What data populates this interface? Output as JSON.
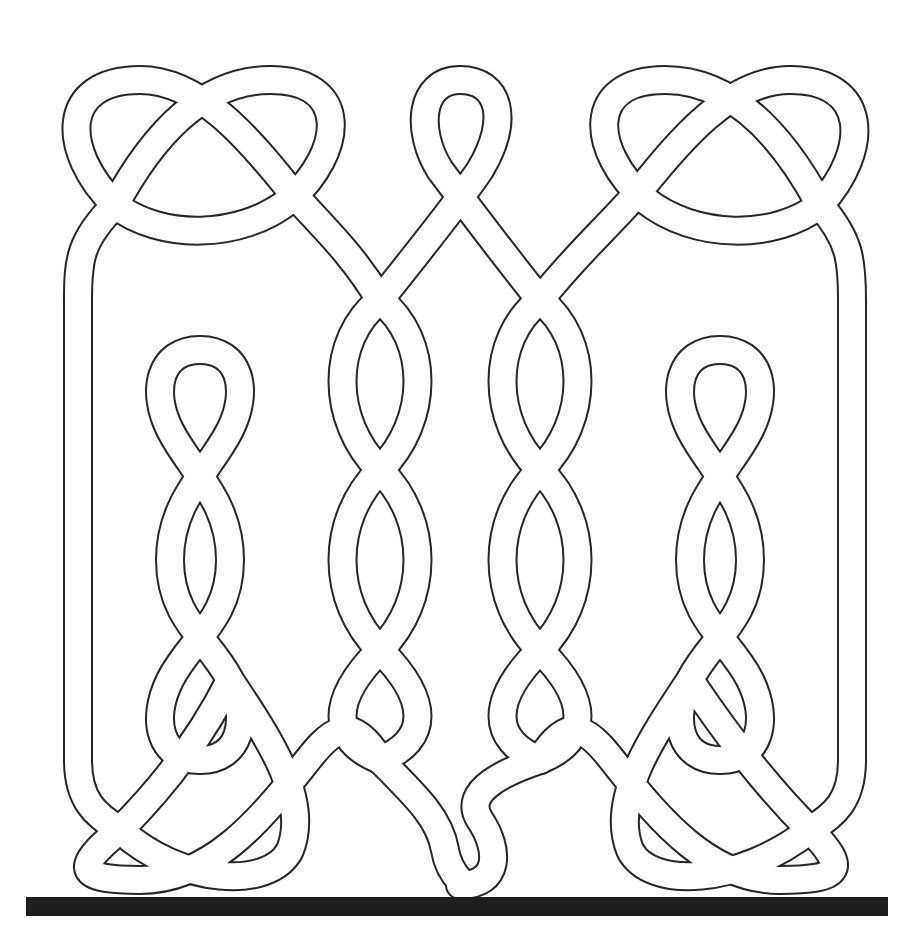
{
  "canvas": {
    "width": 921,
    "height": 949,
    "background": "#ffffff"
  },
  "colors": {
    "line": "#262626",
    "fill": "#ffffff",
    "bar": "#1e1e1e"
  },
  "ribbon": {
    "outer_width": 30,
    "inner_width": 26
  },
  "bar": {
    "x": 26,
    "y": 897,
    "width": 862,
    "height": 19
  },
  "strands": [
    {
      "name": "outer-frame-left",
      "d": "M115,205 C80,240 78,260 78,300 L78,760 C78,800 95,815 120,830"
    },
    {
      "name": "outer-frame-right",
      "d": "M820,205 C850,240 852,260 852,300 L852,760 C852,800 835,815 810,830"
    },
    {
      "name": "top-left-loop",
      "d": "M115,205 C60,150 60,80 140,80 C200,80 250,140 290,190 C320,225 350,250 380,300 M115,205 C160,240 240,240 290,200 C345,150 350,80 270,80 C200,80 150,140 115,205"
    },
    {
      "name": "top-middle-loop",
      "d": "M380,300 C420,250 460,200 480,170 C510,120 500,80 460,80 C420,80 415,130 440,170 C470,210 500,250 540,300"
    },
    {
      "name": "top-right-loop",
      "d": "M540,300 C580,250 610,225 640,190 C680,140 730,80 790,80 C870,80 870,150 820,205 M820,205 C785,140 735,80 665,80 C585,80 590,150 645,200 C695,240 775,240 820,205"
    },
    {
      "name": "left-inner-figure8",
      "d": "M200,350 C160,350 150,390 170,430 C190,470 230,500 230,560 C230,620 190,640 170,680 C150,720 160,760 200,760 C240,760 250,720 230,680 C210,640 170,620 170,560 C170,500 210,470 230,430 C250,390 240,350 200,350 Z"
    },
    {
      "name": "center-left-braid",
      "d": "M380,300 C330,340 330,420 380,470 C430,520 430,600 380,650 C330,700 330,740 380,760"
    },
    {
      "name": "center-left-braid-b",
      "d": "M380,300 C430,340 430,420 380,470 C330,520 330,600 380,650 C430,700 430,740 380,760"
    },
    {
      "name": "center-right-braid",
      "d": "M540,300 C490,340 490,420 540,470 C590,520 590,600 540,650 C490,700 490,740 540,760"
    },
    {
      "name": "center-right-braid-b",
      "d": "M540,300 C590,340 590,420 540,470 C490,520 490,600 540,650 C590,700 590,740 540,760"
    },
    {
      "name": "right-inner-figure8",
      "d": "M720,350 C680,350 670,390 690,430 C710,470 750,500 750,560 C750,620 710,640 690,680 C670,720 680,760 720,760 C760,760 770,720 750,680 C730,640 690,620 690,560 C690,500 730,470 750,430 C770,390 760,350 720,350 Z"
    },
    {
      "name": "bottom-left-loop",
      "d": "M120,830 C70,870 80,880 140,880 C210,880 260,820 300,770 C330,730 350,710 380,760 M120,830 C160,790 200,740 230,680 M230,680 C270,740 310,800 290,850 C270,890 180,885 120,830"
    },
    {
      "name": "bottom-middle-loop",
      "d": "M380,760 C420,800 440,820 445,850 C450,880 470,885 460,885 C500,885 500,850 480,820 C460,790 510,770 540,760"
    },
    {
      "name": "bottom-right-loop",
      "d": "M540,760 C570,710 590,730 620,770 C660,820 710,880 780,880 C840,880 850,870 810,830 M810,830 C770,790 730,740 690,680 M690,680 C650,740 610,800 630,850 C650,890 740,885 810,830"
    }
  ]
}
